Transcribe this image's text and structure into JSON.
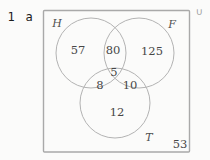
{
  "question": {
    "number": "1",
    "part": "a"
  },
  "venn": {
    "universal_symbol": "∪",
    "set_labels": {
      "H": "H",
      "F": "F",
      "T": "T"
    },
    "region_values": {
      "H_only": "57",
      "H_and_F_only": "80",
      "F_only": "125",
      "H_and_T_only": "8",
      "H_and_F_and_T": "5",
      "F_and_T_only": "10",
      "T_only": "12",
      "outside_circles": "53"
    },
    "colors": {
      "circle_outline": "#b3b3b3",
      "rectangle_border": "#a9a9a9",
      "number_text": "#474747",
      "set_label_text": "#4f4f4f",
      "union_symbol": "#9e9e9e",
      "question_text": "#1c1c1c",
      "background": "#fbfbfa"
    }
  }
}
